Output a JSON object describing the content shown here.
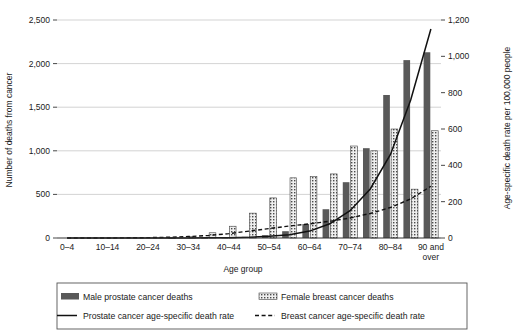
{
  "chart_data": {
    "type": "bar",
    "title": "",
    "xlabel": "Age group",
    "ylabel": "Number of deaths from cancer",
    "y2label": "Age-specific death rate per 100,000 people",
    "ylim": [
      0,
      2500
    ],
    "y2lim": [
      0,
      1200
    ],
    "grid": true,
    "legend_position": "bottom",
    "categories": [
      "0–4",
      "5–9",
      "10–14",
      "15–19",
      "20–24",
      "25–29",
      "30–34",
      "35–39",
      "40–44",
      "45–49",
      "50–54",
      "55–59",
      "60–64",
      "65–69",
      "70–74",
      "75–79",
      "80–84",
      "85–89",
      "90 and over"
    ],
    "visible_tick_labels": [
      "0–4",
      "10–14",
      "20–24",
      "30–34",
      "40–44",
      "50–54",
      "60–64",
      "70–74",
      "80–84",
      "90 and over"
    ],
    "yticks": [
      "0",
      "500",
      "1,000",
      "1,500",
      "2,000",
      "2,500"
    ],
    "y2ticks": [
      "0",
      "200",
      "400",
      "600",
      "800",
      "1,000",
      "1,200"
    ],
    "series": [
      {
        "name": "Male prostate cancer deaths",
        "axis": "left",
        "style": "bar-solid",
        "color": "#595959",
        "values": [
          0,
          0,
          0,
          0,
          0,
          0,
          0,
          2,
          5,
          14,
          32,
          78,
          160,
          330,
          640,
          1030,
          1640,
          2040,
          2130
        ]
      },
      {
        "name": "Female breast cancer deaths",
        "axis": "left",
        "style": "bar-hatched",
        "color": "#595959",
        "values": [
          0,
          0,
          0,
          0,
          0,
          2,
          16,
          60,
          135,
          285,
          460,
          690,
          705,
          735,
          1055,
          1000,
          1250,
          560,
          1230
        ]
      },
      {
        "name": "Prostate cancer age-specific death rate",
        "axis": "right",
        "style": "line-solid",
        "color": "#111111",
        "values": [
          0,
          0,
          0,
          0,
          0,
          0,
          0,
          1,
          2,
          4,
          9,
          18,
          38,
          78,
          150,
          270,
          460,
          760,
          1150
        ]
      },
      {
        "name": "Breast cancer age-specific death rate",
        "axis": "right",
        "style": "line-dashed",
        "color": "#111111",
        "values": [
          0,
          0,
          0,
          1,
          2,
          4,
          8,
          14,
          24,
          38,
          52,
          66,
          78,
          92,
          110,
          135,
          168,
          215,
          285
        ]
      }
    ]
  },
  "legend": {
    "items": [
      {
        "label": "Male prostate cancer deaths",
        "marker": "bar-solid"
      },
      {
        "label": "Female breast cancer deaths",
        "marker": "bar-hatched"
      },
      {
        "label": "Prostate cancer age-specific death rate",
        "marker": "line-solid"
      },
      {
        "label": "Breast cancer age-specific death rate",
        "marker": "line-dashed"
      }
    ]
  },
  "colors": {
    "bar_fill": "#595959",
    "hatch_fill": "#e8e8e8",
    "hatch_stroke": "#444444",
    "line": "#111111",
    "grid": "#c8c8c8",
    "axis": "#333333",
    "background": "#ffffff"
  }
}
